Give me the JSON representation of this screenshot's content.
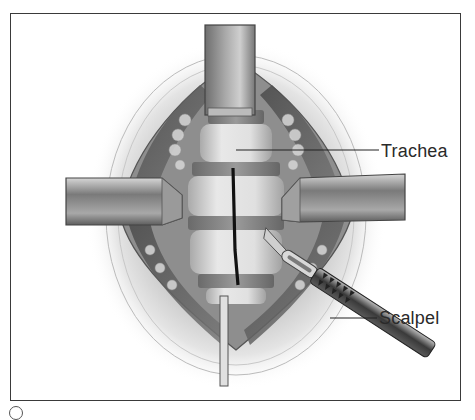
{
  "figure": {
    "labels": [
      {
        "id": "trachea",
        "text": "Trachea"
      },
      {
        "id": "scalpel",
        "text": "Scalpel"
      }
    ],
    "colors": {
      "frame": "#3a3a3a",
      "ink": "#2a2a2a",
      "skin": "#d9d9d9",
      "retractor": "#8a8a8a",
      "cartilage": "#e6e6e6",
      "incision": "#111111"
    }
  }
}
